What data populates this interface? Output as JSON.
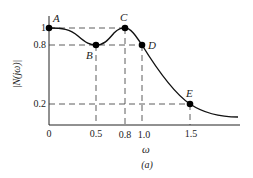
{
  "figure": {
    "caption": "(a)",
    "xlabel": "ω",
    "ylabel": "|N(jω)|",
    "x_ticks": [
      "0",
      "0.5",
      "0.8",
      "1.0",
      "1.5"
    ],
    "y_ticks": [
      "1",
      "0.8",
      "0.2"
    ],
    "points": [
      {
        "label": "A",
        "w": 0,
        "mag": 1
      },
      {
        "label": "B",
        "w": 0.5,
        "mag": 0.8
      },
      {
        "label": "C",
        "w": 0.8,
        "mag": 1
      },
      {
        "label": "D",
        "w": 1.0,
        "mag": 0.8
      },
      {
        "label": "E",
        "w": 1.5,
        "mag": 0.2
      }
    ]
  }
}
